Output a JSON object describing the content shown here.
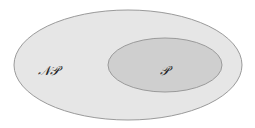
{
  "diagram": {
    "type": "venn-nested-sets",
    "outer_set": {
      "label": "𝒩𝒫",
      "fill": "#e6e6e6",
      "stroke": "#9a9a9a"
    },
    "inner_set": {
      "label": "𝒫",
      "fill": "#cfcfcf",
      "stroke": "#9a9a9a"
    }
  }
}
